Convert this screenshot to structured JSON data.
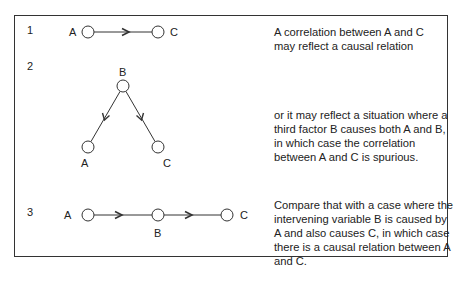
{
  "figure": {
    "panels": [
      {
        "number": "1",
        "nodes": {
          "a": "A",
          "c": "C"
        },
        "description": "A correlation between A and C may reflect a causal relation"
      },
      {
        "number": "2",
        "nodes": {
          "a": "A",
          "b": "B",
          "c": "C"
        },
        "description": "or it may reflect a situation where a third factor B causes both A and B, in which case the correlation between A and C is spurious."
      },
      {
        "number": "3",
        "nodes": {
          "a": "A",
          "b": "B",
          "c": "C"
        },
        "description": "Compare that with a case where the intervening variable B is caused by A and also causes C, in which case there is a causal relation between A and C."
      }
    ]
  }
}
